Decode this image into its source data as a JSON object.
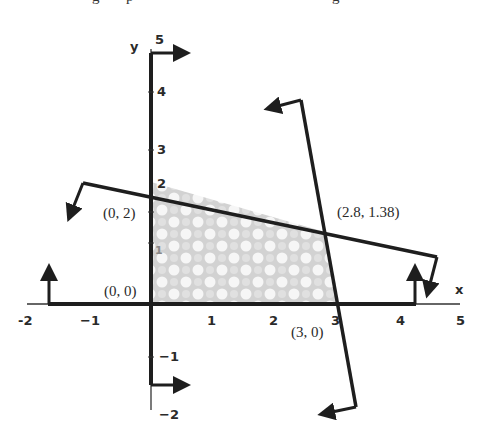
{
  "figure": {
    "title_clipped": "g p g",
    "axes": {
      "x_label": "x",
      "y_label": "y",
      "origin_px": [
        151,
        304
      ],
      "unit_px": 61.5,
      "x_ticks": [
        {
          "value": -2,
          "label": "-2"
        },
        {
          "value": -1,
          "label": "−1"
        },
        {
          "value": 1,
          "label": "1"
        },
        {
          "value": 2,
          "label": "2"
        },
        {
          "value": 3,
          "label": "3"
        },
        {
          "value": 4,
          "label": "4"
        },
        {
          "value": 5,
          "label": "5"
        }
      ],
      "y_ticks": [
        {
          "value": -2,
          "label": "−2"
        },
        {
          "value": -1,
          "label": "−1"
        },
        {
          "value": 1,
          "label": "1"
        },
        {
          "value": 2,
          "label": "2"
        },
        {
          "value": 3,
          "label": "3"
        },
        {
          "value": 4,
          "label": "4"
        },
        {
          "value": 5,
          "label": "5"
        }
      ],
      "x_range": [
        -2,
        5
      ],
      "y_range": [
        -2,
        5
      ]
    },
    "constraints": [
      {
        "name": "x >= 0",
        "description": "y-axis boundary, arrows point right"
      },
      {
        "name": "y >= 0",
        "description": "x-axis boundary, arrows point up"
      },
      {
        "name": "shallow line through (0,2) and (2.8,1.38)",
        "description": "arrows point down"
      },
      {
        "name": "steep line through (2.8,1.38) and (3,0)",
        "description": "arrows point left"
      }
    ],
    "feasible_region": {
      "vertices": [
        [
          0,
          0
        ],
        [
          0,
          2
        ],
        [
          2.8,
          1.38
        ],
        [
          3,
          0
        ]
      ],
      "fill": "checkered gray"
    },
    "point_labels": [
      {
        "text": "(0, 2)",
        "x": 103,
        "y": 218
      },
      {
        "text": "(0, 0)",
        "x": 104,
        "y": 296
      },
      {
        "text": "(2.8, 1.38)",
        "x": 337,
        "y": 217
      },
      {
        "text": "(3, 0)",
        "x": 291,
        "y": 337
      }
    ],
    "colors": {
      "line": "#1e1e1e",
      "shade_dark": "#c8c8c8",
      "shade_light": "#f4f4f4",
      "text": "#2a2a2a"
    }
  }
}
